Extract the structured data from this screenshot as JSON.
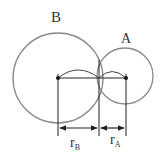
{
  "diagram": {
    "colors": {
      "circle": "#8a8a8a",
      "line": "#222222",
      "text": "#333333",
      "background": "#ffffff"
    },
    "circles": [
      {
        "id": "B",
        "label": "B",
        "cx": 58,
        "cy": 78,
        "r": 45
      },
      {
        "id": "A",
        "label": "A",
        "cx": 125,
        "cy": 76,
        "r": 28
      }
    ],
    "points": [
      {
        "id": "center-B",
        "x": 58,
        "y": 78
      },
      {
        "id": "center-A",
        "x": 126,
        "y": 78
      }
    ],
    "dimensions": [
      {
        "id": "radius-B",
        "label_main": "r",
        "label_sub": "B",
        "x1": 58,
        "x2": 99,
        "y": 128
      },
      {
        "id": "radius-A",
        "label_main": "r",
        "label_sub": "A",
        "x1": 99,
        "x2": 126,
        "y": 128
      }
    ],
    "labels": {
      "circle_B": "B",
      "circle_A": "A",
      "r": "r",
      "sub_B": "B",
      "sub_A": "A"
    }
  }
}
